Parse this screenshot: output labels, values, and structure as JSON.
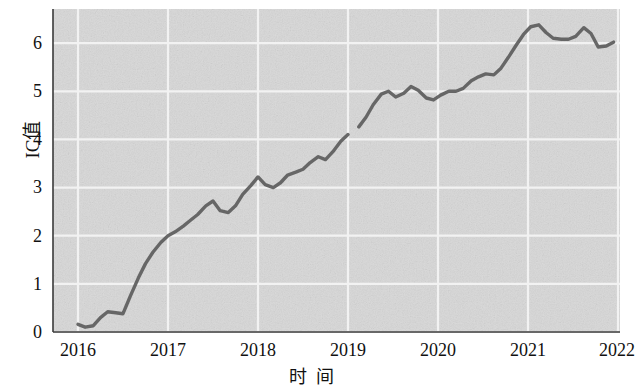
{
  "chart_data": {
    "type": "line",
    "title": "",
    "subtitle": "",
    "xlabel": "时 间",
    "ylabel": "IC值",
    "grid": true,
    "legend": "none",
    "plot_background": "#d9d9d9",
    "line_color": "#5c5c5c",
    "xlim": [
      2016,
      2022
    ],
    "ylim": [
      0,
      6.55
    ],
    "x_tick_labels": [
      "2016",
      "2017",
      "2018",
      "2019",
      "2020",
      "2021",
      "2022"
    ],
    "x_tick_values": [
      2016,
      2017,
      2018,
      2019,
      2020,
      2021,
      2022
    ],
    "y_tick_labels": [
      "0",
      "1",
      "2",
      "3",
      "4",
      "5",
      "6"
    ],
    "y_tick_values": [
      0,
      1,
      2,
      3,
      4,
      5,
      6
    ],
    "series": [
      {
        "name": "IC值",
        "x": [
          2016.0,
          2016.08,
          2016.17,
          2016.25,
          2016.33,
          2016.42,
          2016.5,
          2016.58,
          2016.67,
          2016.75,
          2016.83,
          2016.92,
          2017.0,
          2017.08,
          2017.17,
          2017.25,
          2017.33,
          2017.42,
          2017.5,
          2017.58,
          2017.67,
          2017.75,
          2017.83,
          2017.92,
          2018.0,
          2018.08,
          2018.17,
          2018.25,
          2018.33,
          2018.42,
          2018.5,
          2018.58,
          2018.67,
          2018.75,
          2018.83,
          2018.92,
          2019.0
        ],
        "y": [
          0.16,
          0.1,
          0.13,
          0.3,
          0.42,
          0.4,
          0.38,
          0.74,
          1.12,
          1.42,
          1.65,
          1.86,
          2.0,
          2.08,
          2.2,
          2.32,
          2.44,
          2.62,
          2.72,
          2.52,
          2.48,
          2.62,
          2.86,
          3.04,
          3.22,
          3.06,
          3.0,
          3.1,
          3.26,
          3.32,
          3.38,
          3.52,
          3.64,
          3.58,
          3.74,
          3.96,
          4.1
        ]
      },
      {
        "name": "IC值",
        "x": [
          2019.12,
          2019.2,
          2019.28,
          2019.37,
          2019.45,
          2019.53,
          2019.62,
          2019.7,
          2019.78,
          2019.87,
          2019.95,
          2020.03,
          2020.12,
          2020.2,
          2020.28,
          2020.37,
          2020.45,
          2020.53,
          2020.62,
          2020.7,
          2020.78,
          2020.87,
          2020.95,
          2021.03,
          2021.12,
          2021.2,
          2021.28,
          2021.37,
          2021.45,
          2021.53,
          2021.62,
          2021.7,
          2021.78,
          2021.87,
          2021.95
        ],
        "y": [
          4.26,
          4.46,
          4.72,
          4.94,
          5.0,
          4.88,
          4.96,
          5.1,
          5.02,
          4.86,
          4.82,
          4.92,
          5.0,
          5.0,
          5.06,
          5.22,
          5.3,
          5.36,
          5.34,
          5.48,
          5.7,
          5.96,
          6.18,
          6.34,
          6.38,
          6.22,
          6.1,
          6.08,
          6.08,
          6.14,
          6.32,
          6.2,
          5.92,
          5.94,
          6.02
        ]
      }
    ]
  },
  "axis": {
    "ylabel_text": "IC值",
    "xlabel_left": "时",
    "xlabel_right": "间"
  }
}
